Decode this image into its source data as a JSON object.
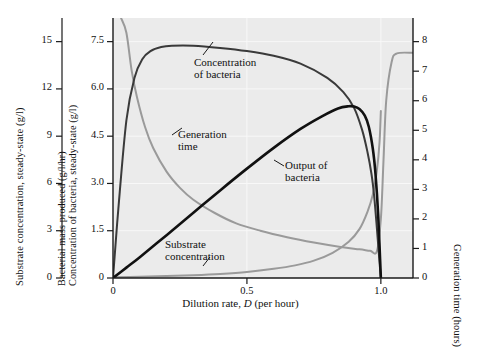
{
  "figure": {
    "background": "#ffffff",
    "plot_background": "#ebebeb",
    "gridline_color": "#f7f7f7",
    "axis_color": "#1a1a1a"
  },
  "chart_data": {
    "type": "line",
    "title": "",
    "xlabel_prefix": "Dilution rate, ",
    "xlabel_symbol": "D",
    "xlabel_suffix": " (per hour)",
    "xlabel": "Dilution rate, D (per hour)",
    "xlim": [
      0,
      1.12
    ],
    "xticks": [
      0,
      0.5,
      1.0
    ],
    "xticklabels": [
      "0",
      "0.5",
      "1.0"
    ],
    "grid": true,
    "legend": "none (direct curve annotations)",
    "axes": [
      {
        "id": "substrate-axis",
        "position": "left-outer",
        "label": "Substrate concentration, steady-state (g/l)",
        "ticks": [
          0,
          3,
          6,
          9,
          12,
          15
        ],
        "ticklabels": [
          "0",
          "3",
          "6",
          "9",
          "12",
          "15"
        ],
        "lim": [
          0,
          16.5
        ]
      },
      {
        "id": "bacteria-axis",
        "position": "left-inner",
        "label_line1": "Bacterial mass produced (g/l/hr)",
        "label_line2": "Concentration of bacteria, steady-state (g/l)",
        "ticks": [
          0,
          1.5,
          3.0,
          4.5,
          6.0,
          7.5
        ],
        "ticklabels": [
          "0",
          "1.5",
          "3.0",
          "4.5",
          "6.0",
          "7.5"
        ],
        "lim": [
          0,
          8.25
        ]
      },
      {
        "id": "generation-time-axis",
        "position": "right",
        "label": "Generation time (hours)",
        "ticks": [
          0,
          1,
          2,
          3,
          4,
          5,
          6,
          7,
          8
        ],
        "ticklabels": [
          "0",
          "1",
          "2",
          "3",
          "4",
          "5",
          "6",
          "7",
          "8"
        ],
        "lim": [
          0,
          8.8
        ]
      }
    ],
    "series": [
      {
        "name": "Concentration of bacteria",
        "annotation": "Concentration of bacteria",
        "axis": "bacteria-axis",
        "color": "#3a3a3a",
        "width": 2.0,
        "x": [
          0.0,
          0.02,
          0.05,
          0.08,
          0.11,
          0.14,
          0.18,
          0.22,
          0.3,
          0.4,
          0.5,
          0.6,
          0.7,
          0.8,
          0.86,
          0.9,
          0.93,
          0.95,
          0.965,
          0.975,
          0.985,
          0.995,
          1.0
        ],
        "y": [
          0.0,
          2.2,
          5.0,
          6.35,
          6.95,
          7.2,
          7.33,
          7.37,
          7.37,
          7.3,
          7.2,
          7.05,
          6.8,
          6.35,
          5.9,
          5.4,
          4.7,
          4.0,
          3.3,
          2.6,
          1.6,
          0.5,
          0.0
        ]
      },
      {
        "name": "Output of bacteria",
        "annotation": "Output of bacteria",
        "axis": "bacteria-axis",
        "color": "#111111",
        "width": 2.6,
        "x": [
          0.0,
          0.05,
          0.1,
          0.2,
          0.3,
          0.4,
          0.5,
          0.6,
          0.7,
          0.78,
          0.84,
          0.88,
          0.9,
          0.92,
          0.94,
          0.955,
          0.97,
          0.98,
          0.99,
          1.0
        ],
        "y": [
          0.0,
          0.33,
          0.66,
          1.36,
          2.07,
          2.78,
          3.47,
          4.13,
          4.73,
          5.13,
          5.38,
          5.45,
          5.44,
          5.36,
          5.15,
          4.8,
          4.1,
          3.3,
          2.0,
          0.0
        ]
      },
      {
        "name": "Generation time",
        "annotation": "Generation time",
        "axis": "generation-time-axis",
        "color": "#9a9a9a",
        "width": 2.0,
        "x": [
          0.03,
          0.05,
          0.07,
          0.09,
          0.12,
          0.15,
          0.2,
          0.25,
          0.3,
          0.38,
          0.46,
          0.55,
          0.65,
          0.75,
          0.85,
          0.92,
          0.96,
          0.985,
          1.0,
          1.01,
          1.02,
          1.04,
          1.06,
          1.12
        ],
        "y": [
          8.8,
          8.3,
          7.0,
          6.1,
          5.1,
          4.4,
          3.6,
          3.05,
          2.65,
          2.2,
          1.85,
          1.6,
          1.38,
          1.2,
          1.05,
          0.97,
          0.92,
          0.9,
          2.0,
          4.0,
          6.0,
          7.3,
          7.6,
          7.62
        ]
      },
      {
        "name": "Substrate concentration",
        "annotation": "Substrate concentration",
        "axis": "substrate-axis",
        "color": "#9a9a9a",
        "width": 2.0,
        "x": [
          0.0,
          0.1,
          0.2,
          0.3,
          0.4,
          0.5,
          0.6,
          0.68,
          0.75,
          0.82,
          0.88,
          0.92,
          0.95,
          0.97,
          0.985,
          0.995,
          1.0
        ],
        "y": [
          0.05,
          0.08,
          0.12,
          0.18,
          0.26,
          0.38,
          0.58,
          0.8,
          1.1,
          1.6,
          2.3,
          3.1,
          4.2,
          5.3,
          6.8,
          8.6,
          10.6
        ]
      }
    ]
  },
  "annotations": [
    {
      "id": "concentration-of-bacteria",
      "line1": "Concentration",
      "line2": "of bacteria"
    },
    {
      "id": "generation-time",
      "line1": "Generation",
      "line2": "time"
    },
    {
      "id": "output-of-bacteria",
      "line1": "Output of",
      "line2": "bacteria"
    },
    {
      "id": "substrate-concentration",
      "line1": "Substrate",
      "line2": "concentration"
    }
  ]
}
